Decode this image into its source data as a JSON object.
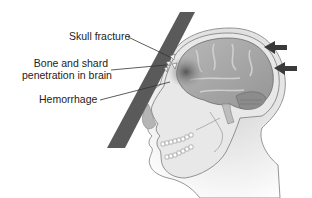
{
  "diagram": {
    "labels": [
      {
        "id": "skull_fracture",
        "text": "Skull fracture"
      },
      {
        "id": "bone_shard",
        "line1": "Bone and shard",
        "line2": "penetration in brain"
      },
      {
        "id": "hemorrhage",
        "text": "Hemorrhage"
      }
    ],
    "arrows": [
      {
        "id": "force_arrow_upper",
        "direction": "left"
      },
      {
        "id": "force_arrow_lower",
        "direction": "left"
      }
    ],
    "colors": {
      "bar": "#5a5a5a",
      "brain": "#a9a9a9",
      "skull": "#e6e6e6",
      "skin": "#d4d4d4",
      "hemorrhage": "#6e6e6e",
      "arrow": "#3a3a3a",
      "text": "#222222"
    }
  }
}
